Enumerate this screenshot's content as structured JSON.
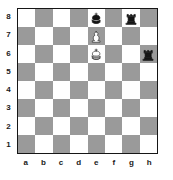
{
  "diagram": {
    "kind": "chess-board",
    "orientation": "white-bottom",
    "board_size": 8,
    "colors": {
      "light_square": "#ffffff",
      "dark_square": "#9a9a9a",
      "border": "#161616",
      "black_piece": "#141414",
      "white_piece": "#ffffff",
      "label_text": "#1a1a1a",
      "page_background": "#ffffff"
    },
    "file_labels": [
      "a",
      "b",
      "c",
      "d",
      "e",
      "f",
      "g",
      "h"
    ],
    "rank_labels": [
      "8",
      "7",
      "6",
      "5",
      "4",
      "3",
      "2",
      "1"
    ],
    "pieces": [
      {
        "square": "e8",
        "file": "e",
        "rank": "8",
        "color": "black",
        "type": "king",
        "icon": "black-king-icon"
      },
      {
        "square": "g8",
        "file": "g",
        "rank": "8",
        "color": "black",
        "type": "rook",
        "icon": "black-rook-icon"
      },
      {
        "square": "e7",
        "file": "e",
        "rank": "7",
        "color": "white",
        "type": "pawn",
        "icon": "white-pawn-icon"
      },
      {
        "square": "e6",
        "file": "e",
        "rank": "6",
        "color": "white",
        "type": "king",
        "icon": "white-king-icon"
      },
      {
        "square": "h6",
        "file": "h",
        "rank": "6",
        "color": "black",
        "type": "rook",
        "icon": "black-rook-icon"
      }
    ],
    "piece_count": 5,
    "empty_ranks": [
      "5",
      "4",
      "3",
      "2",
      "1"
    ]
  }
}
